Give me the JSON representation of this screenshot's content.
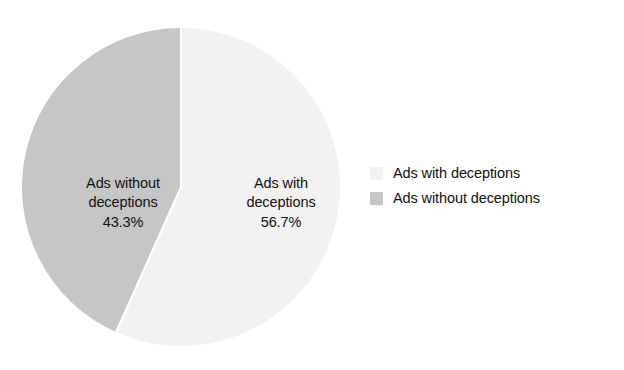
{
  "chart_data": {
    "type": "pie",
    "title": "",
    "categories": [
      "Ads with deceptions",
      "Ads without deceptions"
    ],
    "values": [
      56.7,
      43.3
    ],
    "value_unit": "%",
    "start_angle_deg": 0,
    "direction": "clockwise",
    "grid": false,
    "legend_position": "right",
    "slices": [
      {
        "name": "Ads with deceptions",
        "value": 56.7,
        "label_value": "56.7%",
        "color": "#f2f2f2",
        "label_line1": "Ads with",
        "label_line2": "deceptions"
      },
      {
        "name": "Ads without deceptions",
        "value": 43.3,
        "label_value": "43.3%",
        "color": "#c6c6c6",
        "label_line1": "Ads without",
        "label_line2": "deceptions"
      }
    ]
  },
  "legend": {
    "items": [
      {
        "label": "Ads with deceptions",
        "color": "#f2f2f2"
      },
      {
        "label": "Ads without deceptions",
        "color": "#c6c6c6"
      }
    ]
  },
  "colors": {
    "background": "#ffffff",
    "slice_with_deceptions": "#f2f2f2",
    "slice_without_deceptions": "#c6c6c6",
    "slice_outline": "#ffffff",
    "text": "#111111"
  }
}
